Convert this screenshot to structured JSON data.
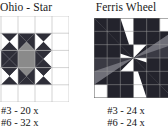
{
  "page": {
    "background": "#ffffff",
    "blocks": [
      {
        "key": "ohio",
        "title": "Ohio - Star",
        "title_truncated": true,
        "grid": "5x5",
        "counts": {
          "line1": "#3 - 20 x",
          "line2": "#6 - 32 x"
        },
        "palette": {
          "dark": "#2e2e38",
          "medium": "#8a8a8a",
          "light": "#ffffff",
          "gridline": "#b6b6b6"
        }
      },
      {
        "key": "ferris",
        "title": "Ferris Wheel",
        "title_truncated": false,
        "grid": "6x6",
        "counts": {
          "line1": "#3 - 24 x",
          "line2": "#6 - 24 x"
        },
        "palette": {
          "dark": "#23232c",
          "medium": "#6f6f78",
          "light": "#ffffff",
          "gridline": "#9a9a9a"
        }
      }
    ]
  }
}
